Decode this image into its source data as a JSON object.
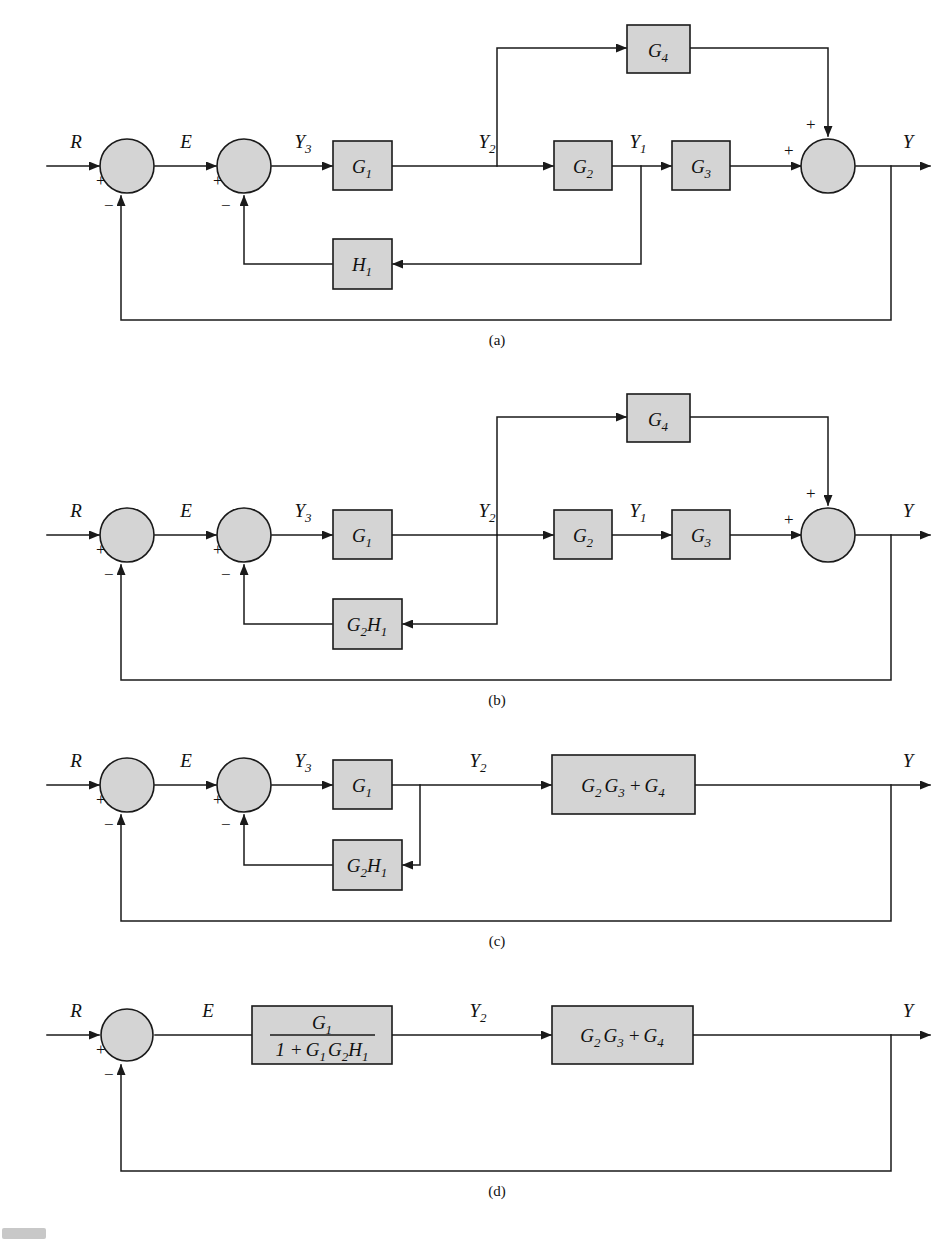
{
  "figure": {
    "type": "control-system-block-diagram",
    "background": "#ffffff",
    "block_fill": "#d4d4d4",
    "line_color": "#1a1a1a",
    "panel_labels": [
      "(a)",
      "(b)",
      "(c)",
      "(d)"
    ]
  },
  "signals": {
    "R": "R",
    "E": "E",
    "Y": "Y",
    "Y1": "Y",
    "Y1_sub": "1",
    "Y2": "Y",
    "Y2_sub": "2",
    "Y3": "Y",
    "Y3_sub": "3"
  },
  "signs": {
    "plus": "+",
    "minus": "−"
  },
  "panel_a": {
    "label": "(a)",
    "input_label": "R",
    "error_label": "E",
    "output_label": "Y",
    "node_y3": "Y",
    "node_y3_sub": "3",
    "node_y2": "Y",
    "node_y2_sub": "2",
    "node_y1": "Y",
    "node_y1_sub": "1",
    "blocks": [
      {
        "name": "G1",
        "base": "G",
        "sub": "1"
      },
      {
        "name": "G2",
        "base": "G",
        "sub": "2"
      },
      {
        "name": "G3",
        "base": "G",
        "sub": "3"
      },
      {
        "name": "G4",
        "base": "G",
        "sub": "4"
      },
      {
        "name": "H1",
        "base": "H",
        "sub": "1"
      }
    ],
    "sum1_signs": [
      "+",
      "−"
    ],
    "sum2_signs": [
      "+",
      "−"
    ],
    "sum3_signs": [
      "+",
      "+"
    ]
  },
  "panel_b": {
    "label": "(b)",
    "input_label": "R",
    "error_label": "E",
    "output_label": "Y",
    "node_y3": "Y",
    "node_y3_sub": "3",
    "node_y2": "Y",
    "node_y2_sub": "2",
    "node_y1": "Y",
    "node_y1_sub": "1",
    "blocks": [
      {
        "name": "G1",
        "base": "G",
        "sub": "1"
      },
      {
        "name": "G2",
        "base": "G",
        "sub": "2"
      },
      {
        "name": "G3",
        "base": "G",
        "sub": "3"
      },
      {
        "name": "G4",
        "base": "G",
        "sub": "4"
      },
      {
        "name": "G2H1",
        "parts": [
          {
            "base": "G",
            "sub": "2"
          },
          {
            "base": "H",
            "sub": "1"
          }
        ]
      }
    ],
    "sum1_signs": [
      "+",
      "−"
    ],
    "sum2_signs": [
      "+",
      "−"
    ],
    "sum3_signs": [
      "+",
      "+"
    ]
  },
  "panel_c": {
    "label": "(c)",
    "input_label": "R",
    "error_label": "E",
    "output_label": "Y",
    "node_y3": "Y",
    "node_y3_sub": "3",
    "node_y2": "Y",
    "node_y2_sub": "2",
    "blocks": [
      {
        "name": "G1",
        "base": "G",
        "sub": "1"
      },
      {
        "name": "G2H1",
        "parts": [
          {
            "base": "G",
            "sub": "2"
          },
          {
            "base": "H",
            "sub": "1"
          }
        ]
      },
      {
        "name": "G2G3_plus_G4",
        "parts": [
          {
            "base": "G",
            "sub": "2"
          },
          {
            "base": "G",
            "sub": "3"
          },
          {
            "op": "+"
          },
          {
            "base": "G",
            "sub": "4"
          }
        ]
      }
    ],
    "sum1_signs": [
      "+",
      "−"
    ],
    "sum2_signs": [
      "+",
      "−"
    ]
  },
  "panel_d": {
    "label": "(d)",
    "input_label": "R",
    "error_label": "E",
    "output_label": "Y",
    "node_y2": "Y",
    "node_y2_sub": "2",
    "blocks": [
      {
        "name": "G1_over_1_plus_G1G2H1",
        "numerator": [
          {
            "base": "G",
            "sub": "1"
          }
        ],
        "denominator": [
          {
            "text": "1 +"
          },
          {
            "base": "G",
            "sub": "1"
          },
          {
            "base": "G",
            "sub": "2"
          },
          {
            "base": "H",
            "sub": "1"
          }
        ]
      },
      {
        "name": "G2G3_plus_G4",
        "parts": [
          {
            "base": "G",
            "sub": "2"
          },
          {
            "base": "G",
            "sub": "3"
          },
          {
            "op": "+"
          },
          {
            "base": "G",
            "sub": "4"
          }
        ]
      }
    ],
    "sum1_signs": [
      "+",
      "−"
    ]
  },
  "footer": {
    "text": ""
  }
}
